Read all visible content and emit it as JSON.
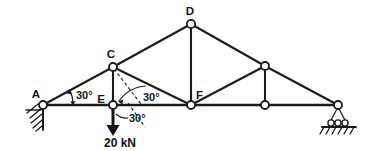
{
  "figure": {
    "type": "structural-truss-diagram",
    "stroke_color": "#1b1b1b",
    "background_color": "#ffffff"
  },
  "joints": [
    {
      "id": "A",
      "label": "A",
      "x": 43,
      "y": 105,
      "labeled": true,
      "label_dx": -4,
      "label_dy": -9
    },
    {
      "id": "C",
      "label": "C",
      "x": 113,
      "y": 67,
      "labeled": true,
      "label_dx": -2,
      "label_dy": -8
    },
    {
      "id": "E",
      "label": "E",
      "x": 113,
      "y": 105,
      "labeled": true,
      "label_dx": -14,
      "label_dy": -3
    },
    {
      "id": "D",
      "label": "D",
      "x": 191,
      "y": 24,
      "labeled": true,
      "label_dx": -1,
      "label_dy": -8
    },
    {
      "id": "F",
      "label": "F",
      "x": 191,
      "y": 105,
      "labeled": true,
      "label_dx": 3,
      "label_dy": -8
    },
    {
      "id": "G",
      "label": "",
      "x": 265,
      "y": 66,
      "labeled": false,
      "label_dx": 0,
      "label_dy": 0
    },
    {
      "id": "H",
      "label": "",
      "x": 265,
      "y": 105,
      "labeled": false,
      "label_dx": 0,
      "label_dy": 0
    },
    {
      "id": "B",
      "label": "",
      "x": 338,
      "y": 105,
      "labeled": false,
      "label_dx": 0,
      "label_dy": 0
    }
  ],
  "members": [
    {
      "name": "A-C",
      "from": "A",
      "to": "C",
      "kind": "rafter"
    },
    {
      "name": "C-D",
      "from": "C",
      "to": "D",
      "kind": "rafter"
    },
    {
      "name": "D-G",
      "from": "D",
      "to": "G",
      "kind": "rafter"
    },
    {
      "name": "G-B",
      "from": "G",
      "to": "B",
      "kind": "rafter"
    },
    {
      "name": "A-E",
      "from": "A",
      "to": "E",
      "kind": "chord"
    },
    {
      "name": "E-F",
      "from": "E",
      "to": "F",
      "kind": "chord"
    },
    {
      "name": "F-H",
      "from": "F",
      "to": "H",
      "kind": "chord"
    },
    {
      "name": "H-B",
      "from": "H",
      "to": "B",
      "kind": "chord"
    },
    {
      "name": "C-E",
      "from": "C",
      "to": "E",
      "kind": "web"
    },
    {
      "name": "C-F",
      "from": "C",
      "to": "F",
      "kind": "web"
    },
    {
      "name": "D-F",
      "from": "D",
      "to": "F",
      "kind": "web"
    },
    {
      "name": "F-G",
      "from": "F",
      "to": "G",
      "kind": "web"
    },
    {
      "name": "G-H",
      "from": "G",
      "to": "H",
      "kind": "web"
    }
  ],
  "angles": [
    {
      "name": "angle-at-A",
      "label": "30°",
      "x": 74,
      "y": 96
    },
    {
      "name": "angle-C-F-member",
      "label": "30°",
      "x": 143,
      "y": 99
    },
    {
      "name": "angle-below-E",
      "label": "30°",
      "x": 129,
      "y": 119
    }
  ],
  "load": {
    "name": "point-load-at-E",
    "label": "20 kN",
    "magnitude": 20,
    "unit": "kN",
    "direction": "downward",
    "applied_at": "E",
    "label_x": 120,
    "label_y": 145
  },
  "supports": [
    {
      "name": "pin-support-left",
      "type": "pinned",
      "at": "A",
      "x": 43,
      "y": 105
    },
    {
      "name": "roller-support-right",
      "type": "roller",
      "at": "B",
      "x": 338,
      "y": 105
    }
  ]
}
